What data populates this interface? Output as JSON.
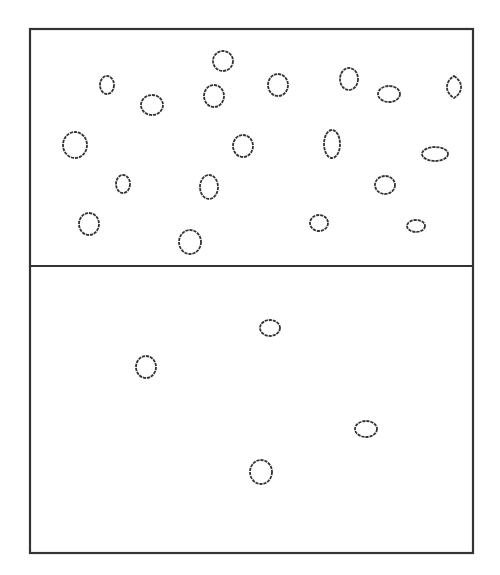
{
  "diagram": {
    "colors": {
      "stroke": "#333333",
      "background": "#ffffff"
    },
    "frame": {
      "x": 30,
      "y": 29,
      "width": 443,
      "height": 524
    },
    "divider_y": 266,
    "compartments": [
      {
        "name": "upper",
        "particle_count": 19,
        "particles": [
          {
            "cx": 107,
            "cy": 85,
            "rx": 7,
            "ry": 9,
            "shape": "ellipse"
          },
          {
            "cx": 152,
            "cy": 105,
            "rx": 11,
            "ry": 10,
            "shape": "ellipse"
          },
          {
            "cx": 223,
            "cy": 61,
            "rx": 10,
            "ry": 10,
            "shape": "ellipse"
          },
          {
            "cx": 214,
            "cy": 96,
            "rx": 10,
            "ry": 11,
            "shape": "ellipse"
          },
          {
            "cx": 278,
            "cy": 85,
            "rx": 10,
            "ry": 11,
            "shape": "ellipse"
          },
          {
            "cx": 349,
            "cy": 79,
            "rx": 9,
            "ry": 11,
            "shape": "ellipse"
          },
          {
            "cx": 389,
            "cy": 94,
            "rx": 11,
            "ry": 8,
            "shape": "ellipse"
          },
          {
            "cx": 454,
            "cy": 87,
            "rx": 7,
            "ry": 11,
            "shape": "lens"
          },
          {
            "cx": 75,
            "cy": 145,
            "rx": 12,
            "ry": 13,
            "shape": "ellipse"
          },
          {
            "cx": 243,
            "cy": 146,
            "rx": 10,
            "ry": 11,
            "shape": "ellipse"
          },
          {
            "cx": 332,
            "cy": 144,
            "rx": 8,
            "ry": 14,
            "shape": "ellipse"
          },
          {
            "cx": 435,
            "cy": 154,
            "rx": 13,
            "ry": 7,
            "shape": "ellipse"
          },
          {
            "cx": 123,
            "cy": 184,
            "rx": 7,
            "ry": 9,
            "shape": "ellipse"
          },
          {
            "cx": 209,
            "cy": 187,
            "rx": 9,
            "ry": 12,
            "shape": "ellipse"
          },
          {
            "cx": 385,
            "cy": 185,
            "rx": 10,
            "ry": 9,
            "shape": "ellipse"
          },
          {
            "cx": 89,
            "cy": 224,
            "rx": 10,
            "ry": 11,
            "shape": "ellipse"
          },
          {
            "cx": 190,
            "cy": 242,
            "rx": 11,
            "ry": 12,
            "shape": "ellipse"
          },
          {
            "cx": 319,
            "cy": 223,
            "rx": 9,
            "ry": 8,
            "shape": "ellipse"
          },
          {
            "cx": 416,
            "cy": 226,
            "rx": 9,
            "ry": 6,
            "shape": "ellipse"
          }
        ]
      },
      {
        "name": "lower",
        "particle_count": 4,
        "particles": [
          {
            "cx": 270,
            "cy": 328,
            "rx": 10,
            "ry": 8,
            "shape": "ellipse"
          },
          {
            "cx": 146,
            "cy": 367,
            "rx": 10,
            "ry": 11,
            "shape": "ellipse"
          },
          {
            "cx": 366,
            "cy": 429,
            "rx": 11,
            "ry": 8,
            "shape": "ellipse"
          },
          {
            "cx": 261,
            "cy": 472,
            "rx": 11,
            "ry": 12,
            "shape": "ellipse"
          }
        ]
      }
    ]
  }
}
